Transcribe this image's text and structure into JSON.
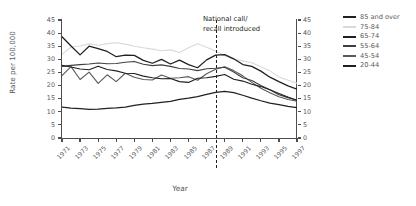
{
  "chart_data": {
    "type": "line",
    "title": "",
    "xlabel": "Year",
    "ylabel": "Rate per 100,000",
    "xlim": [
      1971,
      1997
    ],
    "ylim": [
      0,
      45
    ],
    "y_ticks": [
      0,
      5,
      10,
      15,
      20,
      25,
      30,
      35,
      40,
      45
    ],
    "x_ticks": [
      1971,
      1973,
      1975,
      1977,
      1979,
      1981,
      1983,
      1985,
      1987,
      1989,
      1991,
      1993,
      1995,
      1997
    ],
    "grid": false,
    "legend_position": "right",
    "x": [
      1971,
      1972,
      1973,
      1974,
      1975,
      1976,
      1977,
      1978,
      1979,
      1980,
      1981,
      1982,
      1983,
      1984,
      1985,
      1986,
      1987,
      1988,
      1989,
      1990,
      1991,
      1992,
      1993,
      1994,
      1995,
      1996,
      1997
    ],
    "annotations": [
      {
        "text": "National call/ recall introduced",
        "x": 1988,
        "style": "dashed-vertical-line"
      }
    ],
    "series": [
      {
        "name": "85 and over",
        "color": "#231f20",
        "values": [
          38.6,
          35.1,
          31.7,
          35.0,
          34.1,
          33.0,
          31.0,
          31.6,
          31.5,
          29.6,
          28.5,
          30.0,
          28.2,
          29.7,
          28.0,
          26.8,
          29.8,
          31.6,
          31.8,
          30.2,
          28.0,
          27.3,
          25.5,
          23.2,
          21.5,
          19.9,
          18.6
        ]
      },
      {
        "name": "75-84",
        "color": "#d9d9d9",
        "values": [
          31.9,
          34.7,
          35.1,
          35.9,
          35.4,
          36.0,
          36.3,
          35.8,
          35.0,
          34.4,
          33.9,
          33.3,
          33.6,
          32.6,
          34.4,
          35.9,
          34.6,
          33.2,
          31.4,
          30.0,
          29.4,
          28.7,
          27.2,
          25.6,
          23.3,
          22.0,
          20.9
        ]
      },
      {
        "name": "65-74",
        "color": "#231f20",
        "values": [
          27.7,
          27.1,
          26.3,
          26.0,
          27.4,
          26.1,
          25.6,
          24.7,
          24.6,
          23.6,
          23.0,
          22.6,
          22.7,
          21.5,
          21.2,
          22.8,
          23.0,
          23.5,
          24.2,
          22.4,
          21.7,
          20.5,
          19.6,
          18.4,
          17.0,
          15.6,
          14.3
        ]
      },
      {
        "name": "55-64",
        "color": "#3f3f41",
        "values": [
          27.3,
          27.7,
          28.0,
          28.2,
          28.6,
          28.3,
          28.4,
          28.9,
          29.2,
          28.1,
          27.6,
          27.9,
          27.3,
          26.5,
          26.3,
          25.7,
          26.4,
          26.6,
          27.0,
          25.2,
          23.0,
          21.9,
          20.0,
          18.4,
          16.5,
          15.4,
          14.5
        ]
      },
      {
        "name": "45-54",
        "color": "#58595b",
        "values": [
          23.8,
          27.2,
          22.3,
          25.1,
          20.8,
          24.1,
          21.5,
          24.7,
          23.2,
          22.3,
          22.1,
          24.0,
          22.8,
          23.0,
          23.4,
          22.0,
          24.5,
          26.2,
          27.2,
          25.7,
          23.7,
          21.2,
          19.0,
          17.3,
          15.7,
          14.7,
          14.0
        ]
      },
      {
        "name": "20-44",
        "color": "#231f20",
        "values": [
          11.8,
          11.4,
          11.2,
          10.9,
          11.0,
          11.3,
          11.5,
          11.8,
          12.4,
          12.9,
          13.2,
          13.6,
          14.0,
          14.7,
          15.2,
          15.8,
          16.6,
          17.4,
          17.8,
          17.3,
          16.3,
          15.2,
          14.2,
          13.3,
          12.7,
          12.1,
          11.6
        ]
      }
    ]
  },
  "axes": {
    "ylabel_title": "Rate per 100,000",
    "xlabel_title": "Year"
  }
}
